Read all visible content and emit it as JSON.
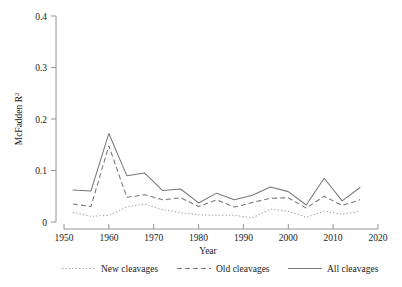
{
  "chart_data": {
    "type": "line",
    "title": "",
    "xlabel": "Year",
    "ylabel": "McFadden R²",
    "xlim": [
      1950,
      2020
    ],
    "ylim": [
      0,
      0.4
    ],
    "grid": false,
    "legend_position": "bottom",
    "xticks": [
      "1950",
      "1960",
      "1970",
      "1980",
      "1990",
      "2000",
      "2010",
      "2020"
    ],
    "xtick_values": [
      1950,
      1960,
      1970,
      1980,
      1990,
      2000,
      2010,
      2020
    ],
    "yticks": [
      "0",
      "0.1",
      "0.2",
      "0.3",
      "0.4"
    ],
    "ytick_values": [
      0,
      0.1,
      0.2,
      0.3,
      0.4
    ],
    "x": [
      1952,
      1956,
      1960,
      1964,
      1968,
      1972,
      1976,
      1980,
      1984,
      1988,
      1992,
      1996,
      2000,
      2004,
      2008,
      2012,
      2016
    ],
    "series": [
      {
        "name": "New cleavages",
        "style": "dotted",
        "color": "#9a9a9a",
        "values": [
          0.019,
          0.011,
          0.013,
          0.029,
          0.035,
          0.024,
          0.018,
          0.014,
          0.013,
          0.013,
          0.008,
          0.025,
          0.021,
          0.009,
          0.021,
          0.015,
          0.021
        ]
      },
      {
        "name": "Old cleavages",
        "style": "dashed",
        "color": "#777777",
        "values": [
          0.035,
          0.03,
          0.148,
          0.048,
          0.053,
          0.043,
          0.047,
          0.03,
          0.043,
          0.029,
          0.038,
          0.046,
          0.047,
          0.027,
          0.05,
          0.032,
          0.043
        ]
      },
      {
        "name": "All cleavages",
        "style": "solid",
        "color": "#777777",
        "values": [
          0.062,
          0.06,
          0.172,
          0.09,
          0.095,
          0.061,
          0.064,
          0.037,
          0.056,
          0.043,
          0.052,
          0.068,
          0.059,
          0.033,
          0.085,
          0.041,
          0.067
        ]
      }
    ],
    "legend": [
      {
        "label": "New cleavages",
        "style": "dotted"
      },
      {
        "label": "Old cleavages",
        "style": "dashed"
      },
      {
        "label": "All cleavages",
        "style": "solid"
      }
    ]
  },
  "axes": {
    "x_title": "Year",
    "y_title_main": "McFadden R",
    "y_title_sup": "2"
  }
}
